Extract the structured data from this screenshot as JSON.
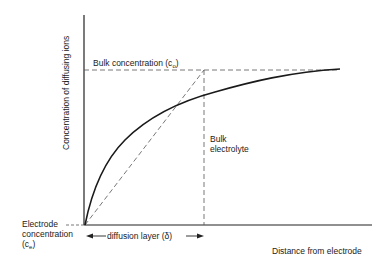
{
  "diagram": {
    "type": "concentration-profile",
    "y_axis_label": "Concentration of diffusing ions",
    "x_axis_label": "Distance from electrode",
    "bulk_concentration_label": "Bulk concentration (c",
    "bulk_concentration_sub": "o",
    "bulk_concentration_close": ")",
    "bulk_electrolyte_line1": "Bulk",
    "bulk_electrolyte_line2": "electrolyte",
    "electrode_concentration_line1": "Electrode",
    "electrode_concentration_line2": "concentration",
    "electrode_concentration_line3": "(c",
    "electrode_concentration_sub": "e",
    "electrode_concentration_close": ")",
    "diffusion_layer_label": "diffusion layer (δ)",
    "colors": {
      "line": "#1a1a1a",
      "dashed": "#555555",
      "background": "#ffffff"
    }
  }
}
